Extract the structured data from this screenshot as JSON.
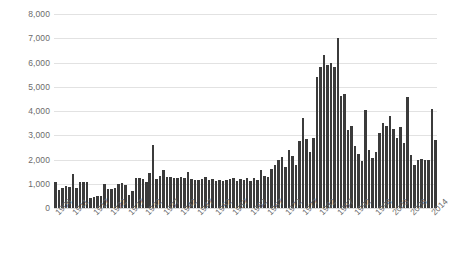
{
  "chart_data": {
    "type": "bar",
    "title": "",
    "subtitle": "",
    "xlabel": "",
    "ylabel": "",
    "ylim": [
      0,
      8000
    ],
    "grid": true,
    "legend": false,
    "legend_position": "none",
    "bar_color": "#3b3b3b",
    "gridline_color": "#e2e2e2",
    "tick_label_color": "#6b6b6b",
    "y_ticks": [
      "0",
      "1,000",
      "2,000",
      "3,000",
      "4,000",
      "5,000",
      "6,000",
      "7,000",
      "8,000"
    ],
    "y_tick_values": [
      0,
      1000,
      2000,
      3000,
      4000,
      5000,
      6000,
      7000,
      8000
    ],
    "x_tick_labels": [
      "1906",
      "1911",
      "1917",
      "1922",
      "1927",
      "1932",
      "1937",
      "1942",
      "1947",
      "1952",
      "1957",
      "1962",
      "1967",
      "1972",
      "1977",
      "1982",
      "1987",
      "1992",
      "1998",
      "2003",
      "2008",
      "2014"
    ],
    "x_tick_indices": [
      0,
      5,
      11,
      16,
      21,
      26,
      31,
      36,
      41,
      46,
      51,
      56,
      61,
      66,
      71,
      76,
      81,
      86,
      92,
      97,
      102,
      108
    ],
    "categories": [
      "1906",
      "1907",
      "1908",
      "1909",
      "1910",
      "1911",
      "1912",
      "1913",
      "1914",
      "1915",
      "1916",
      "1917",
      "1918",
      "1919",
      "1920",
      "1921",
      "1922",
      "1923",
      "1924",
      "1925",
      "1926",
      "1927",
      "1928",
      "1929",
      "1930",
      "1931",
      "1932",
      "1933",
      "1934",
      "1935",
      "1936",
      "1937",
      "1938",
      "1939",
      "1940",
      "1941",
      "1942",
      "1943",
      "1944",
      "1945",
      "1946",
      "1947",
      "1948",
      "1949",
      "1950",
      "1951",
      "1952",
      "1953",
      "1954",
      "1955",
      "1956",
      "1957",
      "1958",
      "1959",
      "1960",
      "1961",
      "1962",
      "1963",
      "1964",
      "1965",
      "1966",
      "1967",
      "1968",
      "1969",
      "1970",
      "1971",
      "1972",
      "1973",
      "1974",
      "1975",
      "1976",
      "1977",
      "1978",
      "1979",
      "1980",
      "1981",
      "1982",
      "1983",
      "1984",
      "1985",
      "1986",
      "1987",
      "1988",
      "1989",
      "1990",
      "1991",
      "1992",
      "1993",
      "1994",
      "1995",
      "1996",
      "1997",
      "1998",
      "1999",
      "2000",
      "2001",
      "2002",
      "2003",
      "2004",
      "2005",
      "2006",
      "2007",
      "2008",
      "2009",
      "2010",
      "2011",
      "2012",
      "2013",
      "2014",
      "2015"
    ],
    "values": [
      1080,
      760,
      820,
      900,
      850,
      1400,
      820,
      1080,
      1090,
      1080,
      430,
      470,
      500,
      500,
      980,
      770,
      780,
      830,
      1000,
      1020,
      960,
      520,
      700,
      1250,
      1240,
      1180,
      1060,
      1460,
      2600,
      1200,
      1300,
      1560,
      1260,
      1260,
      1240,
      1220,
      1270,
      1220,
      1500,
      1180,
      1170,
      1150,
      1200,
      1270,
      1150,
      1180,
      1130,
      1140,
      1120,
      1140,
      1200,
      1220,
      1100,
      1180,
      1160,
      1250,
      1130,
      1240,
      1150,
      1550,
      1340,
      1260,
      1600,
      1780,
      1960,
      2100,
      1690,
      2380,
      2160,
      1770,
      2750,
      3700,
      2860,
      2320,
      2900,
      5400,
      5800,
      6300,
      5900,
      6000,
      5800,
      7000,
      4600,
      4700,
      3200,
      3400,
      2560,
      2220,
      1930,
      4050,
      2380,
      2050,
      2300,
      3100,
      3500,
      3400,
      3800,
      3250,
      2880,
      3350,
      2680,
      4570,
      2200,
      1780,
      2000,
      2030,
      1960,
      1980,
      4100,
      2800
    ]
  }
}
